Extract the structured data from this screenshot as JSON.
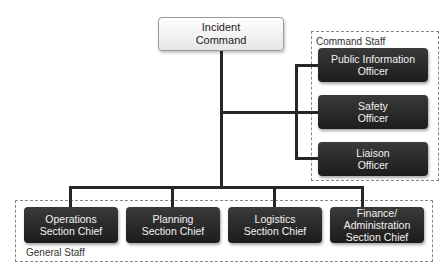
{
  "diagram": {
    "top": {
      "label_line1": "Incident",
      "label_line2": "Command"
    },
    "command_staff": {
      "group_label": "Command Staff",
      "items": [
        {
          "line1": "Public Information",
          "line2": "Officer"
        },
        {
          "line1": "Safety",
          "line2": "Officer"
        },
        {
          "line1": "Liaison",
          "line2": "Officer"
        }
      ]
    },
    "general_staff": {
      "group_label": "General Staff",
      "items": [
        {
          "line1": "Operations",
          "line2": "Section Chief",
          "line3": ""
        },
        {
          "line1": "Planning",
          "line2": "Section Chief",
          "line3": ""
        },
        {
          "line1": "Logistics",
          "line2": "Section Chief",
          "line3": ""
        },
        {
          "line1": "Finance/",
          "line2": "Administration",
          "line3": "Section Chief"
        }
      ]
    },
    "colors": {
      "dark_box": "#262626",
      "line": "#262626",
      "dashed_border": "#888888"
    }
  }
}
